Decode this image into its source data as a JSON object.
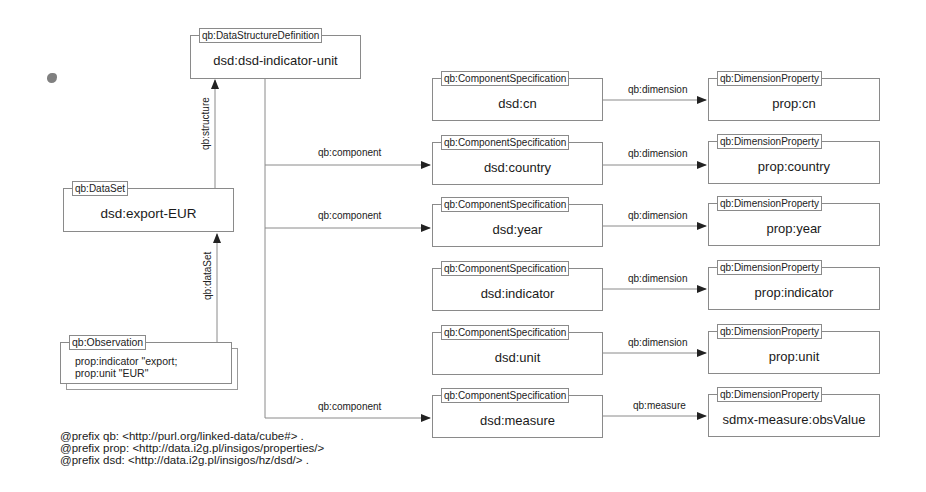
{
  "diagram": {
    "dsd": {
      "type": "qb:DataStructureDefinition",
      "name": "dsd:dsd-indicator-unit"
    },
    "dataset": {
      "type": "qb:DataSet",
      "name": "dsd:export-EUR"
    },
    "observation": {
      "type": "qb:Observation",
      "lines": [
        "prop:indicator \"export;",
        "prop:unit  \"EUR\""
      ]
    },
    "components": [
      {
        "type": "qb:ComponentSpecification",
        "name": "dsd:cn",
        "edge": "qb:dimension",
        "property": {
          "type": "qb:DimensionProperty",
          "name": "prop:cn"
        }
      },
      {
        "type": "qb:ComponentSpecification",
        "name": "dsd:country",
        "edge": "qb:dimension",
        "property": {
          "type": "qb:DimensionProperty",
          "name": "prop:country"
        }
      },
      {
        "type": "qb:ComponentSpecification",
        "name": "dsd:year",
        "edge": "qb:dimension",
        "property": {
          "type": "qb:DimensionProperty",
          "name": "prop:year"
        }
      },
      {
        "type": "qb:ComponentSpecification",
        "name": "dsd:indicator",
        "edge": "qb:dimension",
        "property": {
          "type": "qb:DimensionProperty",
          "name": "prop:indicator"
        }
      },
      {
        "type": "qb:ComponentSpecification",
        "name": "dsd:unit",
        "edge": "qb:dimension",
        "property": {
          "type": "qb:DimensionProperty",
          "name": "prop:unit"
        }
      },
      {
        "type": "qb:ComponentSpecification",
        "name": "dsd:measure",
        "edge": "qb:measure",
        "property": {
          "type": "qb:DimensionProperty",
          "name": "sdmx-measure:obsValue"
        }
      }
    ],
    "edges": {
      "structure": "qb:structure",
      "dataSet": "qb:dataSet",
      "component_labels": [
        "qb:component",
        "qb:component",
        "qb:component"
      ]
    },
    "prefixes": [
      "@prefix qb: <http://purl.org/linked-data/cube#> .",
      "@prefix prop: <http://data.i2g.pl/insigos/properties/>",
      "@prefix dsd: <http://data.i2g.pl/insigos/hz/dsd/> ."
    ]
  },
  "colors": {
    "line": "#8a8a8a",
    "arrow": "#222222",
    "text": "#1a1a1a",
    "background": "#ffffff"
  }
}
